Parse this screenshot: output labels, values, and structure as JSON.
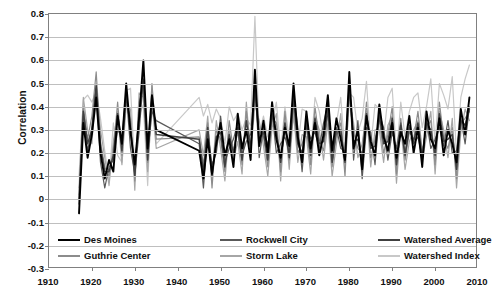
{
  "chart_data": {
    "type": "line",
    "title": "",
    "xlabel": "",
    "ylabel": "Correlation",
    "xlim": [
      1910,
      2010
    ],
    "ylim": [
      -0.3,
      0.8
    ],
    "grid": true,
    "legend_position": "bottom",
    "x_ticks": [
      "1910",
      "1920",
      "1930",
      "1940",
      "1950",
      "1960",
      "1970",
      "1980",
      "1990",
      "2000",
      "2010"
    ],
    "y_ticks": [
      "0.8",
      "0.7",
      "0.6",
      "0.5",
      "0.4",
      "0.3",
      "0.2",
      "0.1",
      "0",
      "-0.1",
      "-0.2",
      "-0.3"
    ],
    "x": [
      1917,
      1918,
      1919,
      1920,
      1921,
      1922,
      1923,
      1924,
      1925,
      1926,
      1927,
      1928,
      1929,
      1930,
      1931,
      1932,
      1933,
      1934,
      1935,
      1945,
      1946,
      1947,
      1948,
      1949,
      1950,
      1951,
      1952,
      1953,
      1954,
      1955,
      1956,
      1957,
      1958,
      1959,
      1960,
      1961,
      1962,
      1963,
      1964,
      1965,
      1966,
      1967,
      1968,
      1969,
      1970,
      1971,
      1972,
      1973,
      1974,
      1975,
      1976,
      1977,
      1978,
      1979,
      1980,
      1981,
      1982,
      1983,
      1984,
      1985,
      1986,
      1987,
      1988,
      1989,
      1990,
      1991,
      1992,
      1993,
      1994,
      1995,
      1996,
      1997,
      1998,
      1999,
      2000,
      2001,
      2002,
      2003,
      2004,
      2005,
      2006,
      2007,
      2008
    ],
    "series": [
      {
        "name": "Des Moines",
        "color": "#000000",
        "width": 1.9,
        "values": [
          -0.06,
          0.33,
          0.18,
          0.28,
          0.44,
          0.2,
          0.09,
          0.17,
          0.12,
          0.36,
          0.24,
          0.5,
          0.29,
          0.15,
          0.35,
          0.6,
          0.22,
          0.45,
          0.3,
          0.21,
          0.09,
          0.26,
          0.11,
          0.24,
          0.33,
          0.19,
          0.26,
          0.14,
          0.37,
          0.22,
          0.3,
          0.17,
          0.56,
          0.23,
          0.34,
          0.2,
          0.42,
          0.26,
          0.18,
          0.31,
          0.23,
          0.5,
          0.27,
          0.16,
          0.38,
          0.22,
          0.33,
          0.19,
          0.28,
          0.45,
          0.21,
          0.35,
          0.26,
          0.17,
          0.55,
          0.22,
          0.3,
          0.13,
          0.36,
          0.25,
          0.19,
          0.41,
          0.27,
          0.21,
          0.33,
          0.18,
          0.29,
          0.24,
          0.36,
          0.2,
          0.31,
          0.14,
          0.38,
          0.26,
          0.22,
          0.35,
          0.19,
          0.3,
          0.24,
          0.16,
          0.39,
          0.28,
          0.44
        ]
      },
      {
        "name": "Guthrie Center",
        "color": "#8c8c8c",
        "width": 1.2,
        "values": [
          0.02,
          0.4,
          0.26,
          0.36,
          0.55,
          0.25,
          0.14,
          0.1,
          0.21,
          0.42,
          0.19,
          0.44,
          0.35,
          0.08,
          0.42,
          0.48,
          0.16,
          0.5,
          0.26,
          0.27,
          0.15,
          0.33,
          0.05,
          0.3,
          0.26,
          0.12,
          0.34,
          0.21,
          0.29,
          0.15,
          0.38,
          0.23,
          0.45,
          0.3,
          0.27,
          0.14,
          0.35,
          0.33,
          0.12,
          0.38,
          0.17,
          0.42,
          0.2,
          0.24,
          0.31,
          0.15,
          0.4,
          0.26,
          0.21,
          0.37,
          0.14,
          0.28,
          0.33,
          0.1,
          0.47,
          0.29,
          0.22,
          0.2,
          0.42,
          0.18,
          0.26,
          0.34,
          0.2,
          0.28,
          0.4,
          0.11,
          0.35,
          0.17,
          0.29,
          0.26,
          0.38,
          0.21,
          0.31,
          0.34,
          0.15,
          0.42,
          0.26,
          0.22,
          0.31,
          0.09,
          0.33,
          0.35,
          0.38
        ]
      },
      {
        "name": "Rockwell City",
        "color": "#595959",
        "width": 1.2,
        "values": [
          -0.02,
          0.36,
          0.21,
          0.31,
          0.48,
          0.16,
          0.05,
          0.14,
          0.17,
          0.3,
          0.27,
          0.46,
          0.22,
          0.11,
          0.29,
          0.52,
          0.19,
          0.38,
          0.34,
          0.24,
          0.05,
          0.29,
          0.15,
          0.2,
          0.36,
          0.16,
          0.22,
          0.26,
          0.33,
          0.19,
          0.25,
          0.28,
          0.5,
          0.18,
          0.31,
          0.23,
          0.38,
          0.2,
          0.24,
          0.27,
          0.2,
          0.46,
          0.31,
          0.12,
          0.34,
          0.26,
          0.29,
          0.22,
          0.33,
          0.41,
          0.17,
          0.31,
          0.22,
          0.21,
          0.51,
          0.17,
          0.34,
          0.09,
          0.31,
          0.29,
          0.15,
          0.37,
          0.31,
          0.17,
          0.29,
          0.22,
          0.33,
          0.2,
          0.32,
          0.24,
          0.27,
          0.18,
          0.34,
          0.22,
          0.26,
          0.31,
          0.23,
          0.34,
          0.2,
          0.21,
          0.35,
          0.24,
          0.4
        ]
      },
      {
        "name": "Storm Lake",
        "color": "#a6a6a6",
        "width": 1.2,
        "values": [
          0.05,
          0.44,
          0.3,
          0.24,
          0.5,
          0.3,
          0.18,
          0.06,
          0.25,
          0.38,
          0.15,
          0.41,
          0.39,
          0.04,
          0.46,
          0.44,
          0.12,
          0.42,
          0.22,
          0.3,
          0.19,
          0.36,
          0.09,
          0.34,
          0.22,
          0.08,
          0.3,
          0.17,
          0.25,
          0.11,
          0.42,
          0.19,
          0.41,
          0.34,
          0.23,
          0.1,
          0.31,
          0.37,
          0.08,
          0.34,
          0.13,
          0.38,
          0.16,
          0.28,
          0.27,
          0.11,
          0.36,
          0.3,
          0.17,
          0.33,
          0.1,
          0.24,
          0.37,
          0.14,
          0.43,
          0.33,
          0.18,
          0.24,
          0.38,
          0.14,
          0.3,
          0.3,
          0.16,
          0.32,
          0.36,
          0.07,
          0.31,
          0.13,
          0.25,
          0.3,
          0.34,
          0.17,
          0.27,
          0.38,
          0.11,
          0.38,
          0.3,
          0.18,
          0.35,
          0.05,
          0.29,
          0.39,
          0.34
        ]
      },
      {
        "name": "Watershed Average",
        "color": "#404040",
        "width": 1.5,
        "values": [
          0.0,
          0.38,
          0.24,
          0.3,
          0.49,
          0.23,
          0.12,
          0.12,
          0.19,
          0.37,
          0.21,
          0.45,
          0.31,
          0.1,
          0.38,
          0.51,
          0.17,
          0.44,
          0.28,
          0.26,
          0.12,
          0.31,
          0.1,
          0.27,
          0.29,
          0.14,
          0.28,
          0.2,
          0.31,
          0.17,
          0.34,
          0.22,
          0.48,
          0.26,
          0.29,
          0.17,
          0.37,
          0.29,
          0.16,
          0.33,
          0.18,
          0.44,
          0.24,
          0.2,
          0.33,
          0.19,
          0.35,
          0.24,
          0.25,
          0.39,
          0.16,
          0.3,
          0.3,
          0.16,
          0.49,
          0.25,
          0.26,
          0.17,
          0.37,
          0.22,
          0.23,
          0.36,
          0.24,
          0.25,
          0.35,
          0.15,
          0.32,
          0.19,
          0.31,
          0.25,
          0.33,
          0.18,
          0.33,
          0.3,
          0.19,
          0.37,
          0.25,
          0.26,
          0.28,
          0.13,
          0.34,
          0.32,
          0.39
        ]
      },
      {
        "name": "Watershed Index",
        "color": "#c8c8c8",
        "width": 1.2,
        "values": [
          0.1,
          0.43,
          0.45,
          0.42,
          0.47,
          0.35,
          0.21,
          0.08,
          0.33,
          0.19,
          0.16,
          0.47,
          0.48,
          0.13,
          0.36,
          0.41,
          0.06,
          0.49,
          0.24,
          0.44,
          0.36,
          0.41,
          0.33,
          0.39,
          0.35,
          0.24,
          0.4,
          0.34,
          0.37,
          0.3,
          0.35,
          0.32,
          0.79,
          0.28,
          0.36,
          0.27,
          0.33,
          0.42,
          0.21,
          0.4,
          0.26,
          0.35,
          0.22,
          0.39,
          0.38,
          0.2,
          0.44,
          0.38,
          0.26,
          0.36,
          0.22,
          0.33,
          0.44,
          0.21,
          0.46,
          0.44,
          0.29,
          0.35,
          0.51,
          0.23,
          0.41,
          0.39,
          0.27,
          0.44,
          0.48,
          0.19,
          0.42,
          0.27,
          0.38,
          0.44,
          0.46,
          0.31,
          0.4,
          0.52,
          0.24,
          0.5,
          0.45,
          0.39,
          0.53,
          0.19,
          0.44,
          0.52,
          0.58
        ]
      }
    ]
  },
  "legend": {
    "items": [
      {
        "label": "Des Moines"
      },
      {
        "label": "Guthrie Center"
      },
      {
        "label": "Rockwell City"
      },
      {
        "label": "Storm Lake"
      },
      {
        "label": "Watershed Average"
      },
      {
        "label": "Watershed Index"
      }
    ]
  }
}
